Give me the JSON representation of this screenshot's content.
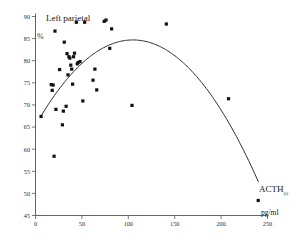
{
  "chart_data": {
    "type": "scatter",
    "title": "Left parietal",
    "xlabel": "ACTH",
    "xlabel_subscript": "(t)",
    "xunit": "pg/ml",
    "ylabel": "%",
    "xlim": [
      0,
      250
    ],
    "ylim": [
      45,
      90
    ],
    "xticks": [
      0,
      50,
      100,
      150,
      200,
      250
    ],
    "yticks": [
      45,
      50,
      55,
      60,
      65,
      70,
      75,
      80,
      85,
      90
    ],
    "grid": false,
    "legend": null,
    "marker_style": "filled-square",
    "marker_color": "#111111",
    "points": [
      {
        "x": 6,
        "y": 67.4
      },
      {
        "x": 17,
        "y": 74.6
      },
      {
        "x": 18,
        "y": 73.3
      },
      {
        "x": 19,
        "y": 74.5
      },
      {
        "x": 20,
        "y": 58.4
      },
      {
        "x": 21,
        "y": 86.7
      },
      {
        "x": 22,
        "y": 69.0
      },
      {
        "x": 26,
        "y": 78.0
      },
      {
        "x": 29,
        "y": 65.5
      },
      {
        "x": 30,
        "y": 68.6
      },
      {
        "x": 31,
        "y": 84.2
      },
      {
        "x": 33,
        "y": 69.7
      },
      {
        "x": 34,
        "y": 81.6
      },
      {
        "x": 35,
        "y": 76.8
      },
      {
        "x": 36,
        "y": 80.9
      },
      {
        "x": 37,
        "y": 80.6
      },
      {
        "x": 38,
        "y": 79.0
      },
      {
        "x": 39,
        "y": 78.1
      },
      {
        "x": 40,
        "y": 74.7
      },
      {
        "x": 41,
        "y": 80.9
      },
      {
        "x": 42,
        "y": 81.7
      },
      {
        "x": 44,
        "y": 88.7
      },
      {
        "x": 45,
        "y": 79.3
      },
      {
        "x": 46,
        "y": 79.6
      },
      {
        "x": 48,
        "y": 79.8
      },
      {
        "x": 51,
        "y": 70.9
      },
      {
        "x": 53,
        "y": 88.7
      },
      {
        "x": 62,
        "y": 75.6
      },
      {
        "x": 64,
        "y": 78.1
      },
      {
        "x": 66,
        "y": 73.4
      },
      {
        "x": 74,
        "y": 88.9
      },
      {
        "x": 76,
        "y": 89.2
      },
      {
        "x": 80,
        "y": 82.8
      },
      {
        "x": 82,
        "y": 87.2
      },
      {
        "x": 104,
        "y": 69.9
      },
      {
        "x": 141,
        "y": 88.3
      },
      {
        "x": 208,
        "y": 71.4
      },
      {
        "x": 240,
        "y": 48.4
      }
    ],
    "fit_curve": {
      "type": "quadratic",
      "label": "fitted regression curve",
      "color": "#2b2b2b",
      "x_start": 6,
      "x_end": 240,
      "vertex_x": 105,
      "vertex_y": 84.7,
      "y_at_start": 67.4,
      "y_at_end": 52.7
    }
  }
}
